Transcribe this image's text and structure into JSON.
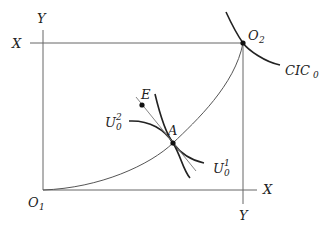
{
  "diagram": {
    "type": "edgeworth-box",
    "axes": {
      "left_top_label": "Y",
      "top_left_label": "X",
      "bottom_right_label": "X",
      "right_bottom_label": "Y"
    },
    "origins": {
      "o1": {
        "base": "O",
        "sub": "1"
      },
      "o2": {
        "base": "O",
        "sub": "2"
      }
    },
    "points": {
      "a": "A",
      "e": "E"
    },
    "curves": {
      "cic": {
        "base": "CIC",
        "sub": "0"
      },
      "u2": {
        "base": "U",
        "sup": "2",
        "sub": "0"
      },
      "u1": {
        "base": "U",
        "sup": "1",
        "sub": "0"
      }
    },
    "colors": {
      "line": "#222222",
      "thin_line": "#555555"
    }
  }
}
